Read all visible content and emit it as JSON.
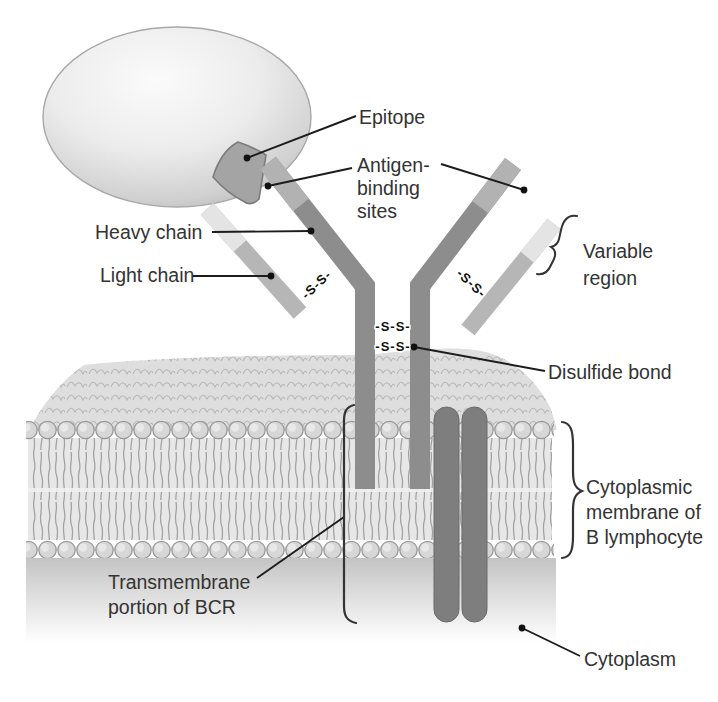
{
  "figure": {
    "type": "biology-diagram",
    "background": "#ffffff",
    "labels": {
      "epitope": "Epitope",
      "antigen_binding": [
        "Antigen-",
        "binding",
        "sites"
      ],
      "heavy_chain": "Heavy chain",
      "light_chain": "Light chain",
      "variable_region": [
        "Variable",
        "region"
      ],
      "disulfide_bond": "Disulfide bond",
      "disulfide_text": "-S-S-",
      "membrane": [
        "Cytoplasmic",
        "membrane of",
        "B lymphocyte"
      ],
      "transmembrane": [
        "Transmembrane",
        "portion of BCR"
      ],
      "cytoplasm": "Cytoplasm"
    },
    "colors": {
      "heavy_chain": "#8d8d8d",
      "chain_tip": "#b2b2b2",
      "light_chain": "#b6b6b6",
      "light_tip": "#e4e4e4",
      "accessory_rod": "#7e7e7e",
      "epitope": "#a4a4a4",
      "epitope_outline": "#7c7c7c",
      "sphere_edge": "#a8a8a8",
      "membrane_head": "#d7d7d7",
      "label_text": "#333333",
      "leader_line": "#1c1c1c"
    }
  }
}
